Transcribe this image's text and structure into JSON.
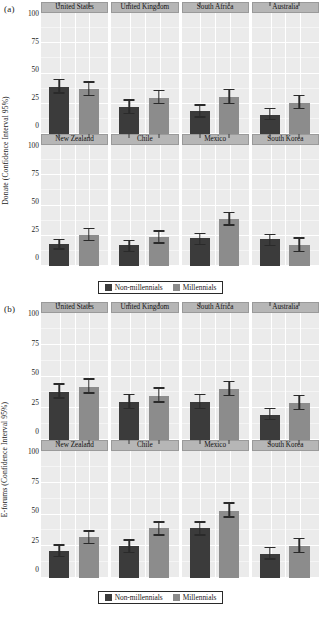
{
  "figure": {
    "panels": [
      {
        "letter": "(a)",
        "ylabel": "Donate (Confidence Interval 95%)"
      },
      {
        "letter": "(b)",
        "ylabel": "E-forums (Confidence Interval 95%)"
      }
    ],
    "legend": {
      "items": [
        {
          "label": "Non-millennials",
          "color": "#3b3b3b"
        },
        {
          "label": "Millennials",
          "color": "#8c8c8c"
        }
      ]
    },
    "ticks": [
      "100",
      "75",
      "50",
      "25",
      "0"
    ]
  },
  "chart_data": [
    {
      "type": "bar",
      "title": "(a)",
      "xlabel": "",
      "ylabel": "Donate (Confidence Interval 95%)",
      "ylim": [
        0,
        100
      ],
      "yticks": [
        0,
        25,
        50,
        75,
        100
      ],
      "grid": true,
      "legend_position": "bottom",
      "facets": [
        "United States",
        "United Kingdom",
        "South Africa",
        "Australia",
        "New Zealand",
        "Chile",
        "Mexico",
        "South Korea"
      ],
      "categories": [
        "Non-millennials",
        "Millennials"
      ],
      "series": [
        {
          "name": "Non-millennials",
          "color": "#3b3b3b",
          "values": [
            39,
            22,
            19,
            16,
            18,
            17,
            23,
            22
          ],
          "ci_low": [
            34,
            17,
            14,
            12,
            14,
            12,
            18,
            17
          ],
          "ci_high": [
            45,
            28,
            24,
            21,
            22,
            21,
            27,
            26
          ]
        },
        {
          "name": "Millennials",
          "color": "#8c8c8c",
          "values": [
            37,
            30,
            31,
            26,
            26,
            24,
            39,
            17
          ],
          "ci_low": [
            32,
            25,
            25,
            21,
            21,
            19,
            34,
            12
          ],
          "ci_high": [
            43,
            36,
            37,
            32,
            31,
            29,
            44,
            23
          ]
        }
      ]
    },
    {
      "type": "bar",
      "title": "(b)",
      "xlabel": "",
      "ylabel": "E-forums (Confidence Interval 95%)",
      "ylim": [
        0,
        100
      ],
      "yticks": [
        0,
        25,
        50,
        75,
        100
      ],
      "grid": true,
      "legend_position": "bottom",
      "facets": [
        "United States",
        "United Kingdom",
        "South Africa",
        "Australia",
        "New Zealand",
        "Chile",
        "Mexico",
        "South Korea"
      ],
      "categories": [
        "Non-millennials",
        "Millennials"
      ],
      "series": [
        {
          "name": "Non-millennials",
          "color": "#3b3b3b",
          "values": [
            38,
            30,
            30,
            20,
            21,
            25,
            39,
            19
          ],
          "ci_low": [
            33,
            25,
            25,
            16,
            17,
            20,
            34,
            15
          ],
          "ci_high": [
            44,
            36,
            36,
            25,
            26,
            30,
            44,
            24
          ]
        },
        {
          "name": "Millennials",
          "color": "#8c8c8c",
          "values": [
            42,
            35,
            40,
            29,
            32,
            39,
            53,
            25
          ],
          "ci_low": [
            37,
            30,
            35,
            24,
            27,
            34,
            48,
            20
          ],
          "ci_high": [
            48,
            41,
            46,
            35,
            37,
            44,
            59,
            31
          ]
        }
      ]
    }
  ]
}
